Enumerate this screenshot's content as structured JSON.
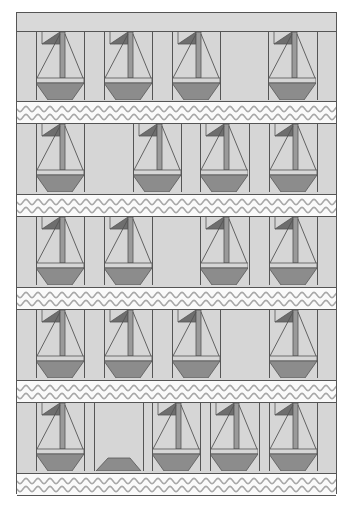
{
  "colors": {
    "background": "#d6d6d6",
    "outline": "#555555",
    "hull": "#8c8c8c",
    "mast": "#9a9a9a",
    "flag": "#6e6e6e",
    "wave_fill": "#fafafa",
    "wave_line": "#a8a8a8"
  },
  "quilt": {
    "rows": [
      {
        "top": 19,
        "wave_top": 88,
        "blocks": [
          {
            "x": 19,
            "type": "boat"
          },
          {
            "x": 87,
            "type": "boat"
          },
          {
            "x": 155,
            "type": "boat"
          },
          {
            "x": 251,
            "type": "boat"
          }
        ],
        "lines": [
          19,
          67,
          87,
          135,
          155,
          203,
          251,
          300
        ]
      },
      {
        "top": 111,
        "wave_top": 181,
        "blocks": [
          {
            "x": 19,
            "type": "boat"
          },
          {
            "x": 116,
            "type": "boat"
          },
          {
            "x": 183,
            "type": "boat"
          },
          {
            "x": 252,
            "type": "boat"
          }
        ],
        "lines": [
          19,
          67,
          116,
          164,
          183,
          232,
          252,
          300
        ]
      },
      {
        "top": 204,
        "wave_top": 274,
        "blocks": [
          {
            "x": 19,
            "type": "boat"
          },
          {
            "x": 87,
            "type": "boat"
          },
          {
            "x": 183,
            "type": "boat"
          },
          {
            "x": 252,
            "type": "boat"
          }
        ],
        "lines": [
          19,
          67,
          87,
          135,
          183,
          232,
          252,
          300
        ]
      },
      {
        "top": 297,
        "wave_top": 367,
        "blocks": [
          {
            "x": 19,
            "type": "boat"
          },
          {
            "x": 87,
            "type": "boat"
          },
          {
            "x": 155,
            "type": "boat"
          },
          {
            "x": 252,
            "type": "boat"
          }
        ],
        "lines": [
          19,
          67,
          87,
          135,
          155,
          203,
          252,
          300
        ]
      },
      {
        "top": 390,
        "wave_top": 460,
        "blocks": [
          {
            "x": 19,
            "type": "boat"
          },
          {
            "x": 77,
            "type": "hull-only"
          },
          {
            "x": 135,
            "type": "boat"
          },
          {
            "x": 193,
            "type": "boat"
          },
          {
            "x": 252,
            "type": "boat"
          }
        ],
        "lines": [
          19,
          67,
          77,
          126,
          135,
          183,
          193,
          242,
          252,
          300
        ]
      }
    ]
  }
}
